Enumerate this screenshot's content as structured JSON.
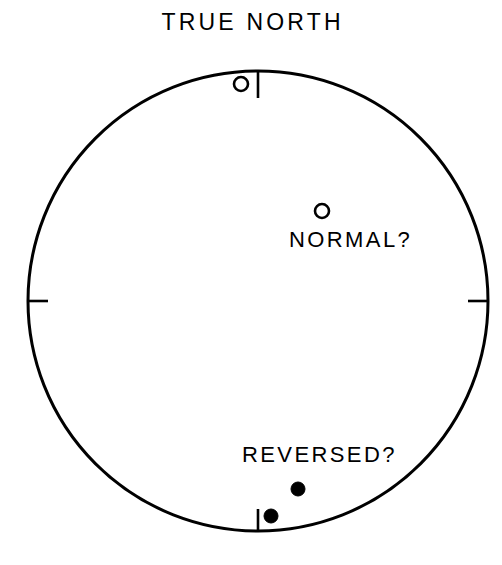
{
  "figure": {
    "title": "TRUE NORTH",
    "background_color": "#ffffff",
    "line_color": "#000000",
    "labels": {
      "normal": "NORMAL?",
      "reversed": "REVERSED?"
    }
  },
  "chart_data": {
    "type": "scatter",
    "title": "TRUE NORTH",
    "subtitle": "",
    "xlabel": "",
    "ylabel": "",
    "projection": "equal-area stereonet (paleomagnetic directions)",
    "grid": false,
    "legend_position": "inline-annotations",
    "net": {
      "center_x": 258,
      "center_y": 301,
      "radius": 230,
      "stroke_width": 3,
      "azimuth_ticks": [
        {
          "label": "N",
          "azimuth_deg": 0,
          "inward_length_px": 27
        },
        {
          "label": "E",
          "azimuth_deg": 90,
          "inward_length_px": 20
        },
        {
          "label": "S",
          "azimuth_deg": 180,
          "inward_length_px": 22
        },
        {
          "label": "W",
          "azimuth_deg": 270,
          "inward_length_px": 20
        }
      ]
    },
    "annotations": [
      {
        "text": "TRUE NORTH",
        "x": 258,
        "y": 24,
        "role": "figure-title"
      },
      {
        "text": "NORMAL?",
        "x": 352,
        "y": 240,
        "role": "group-label"
      },
      {
        "text": "REVERSED?",
        "x": 316,
        "y": 455,
        "role": "group-label"
      }
    ],
    "series": [
      {
        "name": "NORMAL?",
        "marker": "open-circle",
        "marker_fill": "#ffffff",
        "marker_stroke": "#000000",
        "marker_radius_px": 7,
        "points": [
          {
            "x": 241,
            "y": 84,
            "declination_deg": 355.8,
            "inclination_deg": 18.8
          },
          {
            "x": 322,
            "y": 211,
            "declination_deg": 32.6,
            "inclination_deg": 67.1
          }
        ]
      },
      {
        "name": "REVERSED?",
        "marker": "filled-circle",
        "marker_fill": "#000000",
        "marker_stroke": "#000000",
        "marker_radius_px": 7,
        "points": [
          {
            "x": 298,
            "y": 489,
            "declination_deg": 167.9,
            "inclination_deg": 39.1
          },
          {
            "x": 271,
            "y": 516,
            "declination_deg": 176.4,
            "inclination_deg": 22.8
          }
        ]
      }
    ]
  }
}
